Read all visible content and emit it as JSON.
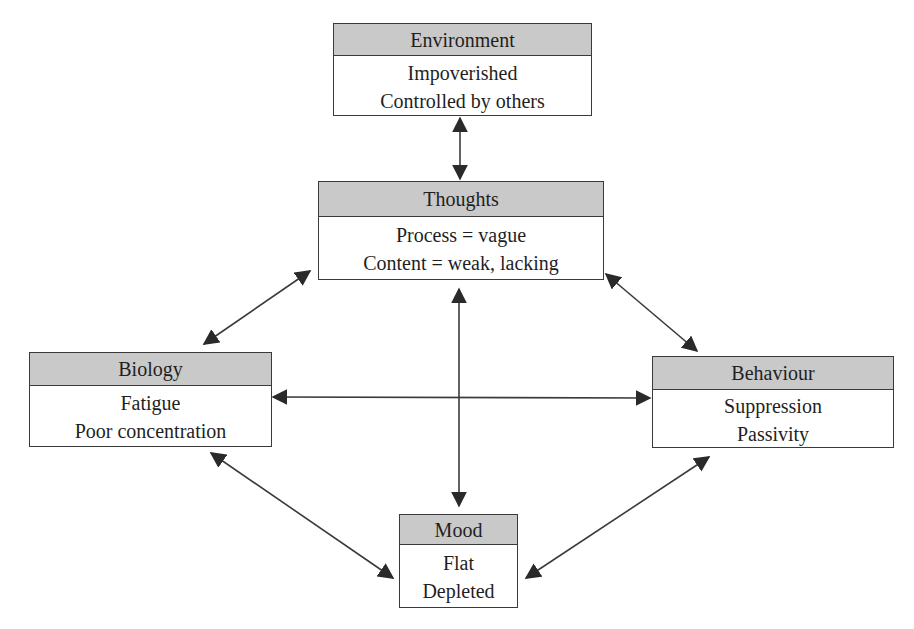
{
  "diagram": {
    "type": "five-areas-model",
    "colors": {
      "header_fill": "#c9c9c9",
      "border": "#3a3a3a",
      "arrow": "#2a2a2a",
      "text": "#1f1f1f"
    },
    "nodes": {
      "environment": {
        "title": "Environment",
        "lines": [
          "Impoverished",
          "Controlled by others"
        ]
      },
      "thoughts": {
        "title": "Thoughts",
        "lines": [
          "Process = vague",
          "Content = weak, lacking"
        ]
      },
      "biology": {
        "title": "Biology",
        "lines": [
          "Fatigue",
          "Poor concentration"
        ]
      },
      "behaviour": {
        "title": "Behaviour",
        "lines": [
          "Suppression",
          "Passivity"
        ]
      },
      "mood": {
        "title": "Mood",
        "lines": [
          "Flat",
          "Depleted"
        ]
      }
    },
    "edges": [
      {
        "from": "environment",
        "to": "thoughts",
        "bidirectional": true
      },
      {
        "from": "thoughts",
        "to": "biology",
        "bidirectional": true
      },
      {
        "from": "thoughts",
        "to": "behaviour",
        "bidirectional": true
      },
      {
        "from": "thoughts",
        "to": "mood",
        "bidirectional": true
      },
      {
        "from": "biology",
        "to": "behaviour",
        "bidirectional": true
      },
      {
        "from": "biology",
        "to": "mood",
        "bidirectional": true
      },
      {
        "from": "behaviour",
        "to": "mood",
        "bidirectional": true
      }
    ]
  }
}
